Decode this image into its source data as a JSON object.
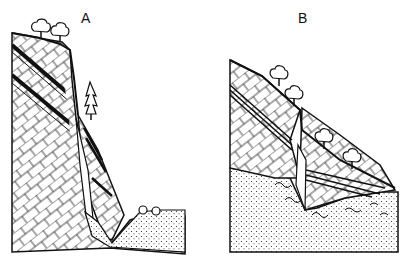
{
  "diagram": {
    "panels": [
      {
        "id": "A",
        "label": "A",
        "description": "cross-section: steep cliff of bedded rock with wedge-shaped rock slab slid into valley, debris pile at base, trees on top and conifer on slide"
      },
      {
        "id": "B",
        "label": "B",
        "description": "cross-section: bedded rock block slid down over dotted sediment, trees on slope, wavy debris at contact"
      }
    ],
    "colors": {
      "ink": "#111111",
      "background": "#ffffff"
    }
  }
}
